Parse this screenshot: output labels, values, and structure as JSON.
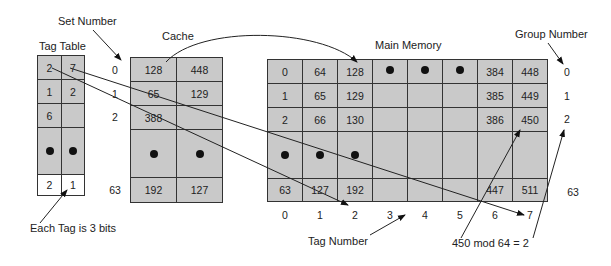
{
  "labels": {
    "set_number": "Set Number",
    "tag_table": "Tag Table",
    "cache": "Cache",
    "main_memory": "Main Memory",
    "group_number": "Group Number",
    "each_tag": "Each Tag is 3 bits",
    "tag_number": "Tag Number",
    "mod_note": "450 mod 64 = 2"
  },
  "tag_table": {
    "rows": [
      [
        "2",
        "7"
      ],
      [
        "1",
        "2"
      ],
      [
        "6",
        ""
      ],
      [
        "•",
        "•"
      ],
      [
        "2",
        "1"
      ]
    ]
  },
  "set_numbers": [
    "0",
    "1",
    "2",
    "63"
  ],
  "cache": {
    "rows": [
      [
        "128",
        "448"
      ],
      [
        "65",
        "129"
      ],
      [
        "388",
        ""
      ],
      [
        "•",
        "•"
      ],
      [
        "192",
        "127"
      ]
    ]
  },
  "main_memory": {
    "rows": [
      [
        "0",
        "64",
        "128",
        "•",
        "•",
        "•",
        "384",
        "448"
      ],
      [
        "1",
        "65",
        "129",
        "",
        "",
        "",
        "385",
        "449"
      ],
      [
        "2",
        "66",
        "130",
        "",
        "",
        "",
        "386",
        "450"
      ],
      [
        "•",
        "•",
        "•",
        "",
        "",
        "",
        "",
        ""
      ],
      [
        "63",
        "127",
        "192",
        "",
        "",
        "",
        "447",
        "511"
      ]
    ],
    "column_tags": [
      "0",
      "1",
      "2",
      "3",
      "4",
      "5",
      "6",
      "7"
    ]
  },
  "group_numbers": [
    "0",
    "1",
    "2",
    "63"
  ]
}
